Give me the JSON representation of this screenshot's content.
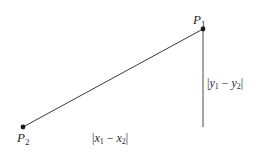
{
  "diagram": {
    "type": "right-triangle-distance",
    "points": {
      "P1": {
        "label": "P",
        "subscript": "1",
        "x": 203,
        "y": 29
      },
      "P2": {
        "label": "P",
        "subscript": "2",
        "x": 23,
        "y": 127
      },
      "corner": {
        "x": 203,
        "y": 127
      }
    },
    "horizontal_label": {
      "open": "|",
      "var1": "x",
      "sub1": "1",
      "minus": " − ",
      "var2": "x",
      "sub2": "2",
      "close": "|"
    },
    "vertical_label": {
      "open": "|",
      "var1": "y",
      "sub1": "1",
      "minus": " − ",
      "var2": "y",
      "sub2": "2",
      "close": "|"
    },
    "colors": {
      "line": "#3a3a3a",
      "dot": "#1a1a1a",
      "base_start": "#2a3a5a",
      "base_mid": "#c8d890",
      "base_end": "#7ab8b0"
    }
  }
}
